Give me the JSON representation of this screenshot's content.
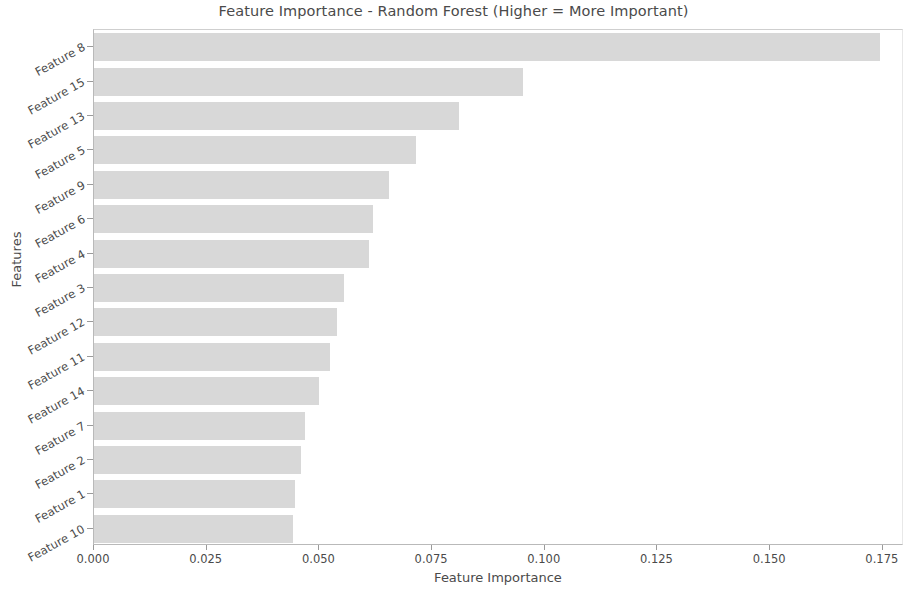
{
  "chart_data": {
    "type": "bar",
    "orientation": "horizontal",
    "title": "Feature Importance - Random Forest (Higher = More Important)",
    "xlabel": "Feature Importance",
    "ylabel": "Features",
    "categories": [
      "Feature 8",
      "Feature 15",
      "Feature 13",
      "Feature 5",
      "Feature 9",
      "Feature 6",
      "Feature 4",
      "Feature 3",
      "Feature 12",
      "Feature 11",
      "Feature 14",
      "Feature 7",
      "Feature 2",
      "Feature 1",
      "Feature 10"
    ],
    "values": [
      0.1743,
      0.0951,
      0.0809,
      0.0714,
      0.0654,
      0.0619,
      0.061,
      0.0554,
      0.0539,
      0.0523,
      0.0499,
      0.0468,
      0.0459,
      0.0446,
      0.0441
    ],
    "xlim": [
      0.0,
      0.1797
    ],
    "xticks": [
      0.0,
      0.025,
      0.05,
      0.075,
      0.1,
      0.125,
      0.15,
      0.175
    ],
    "xtick_labels": [
      "0.000",
      "0.025",
      "0.050",
      "0.075",
      "0.100",
      "0.125",
      "0.150",
      "0.175"
    ],
    "grid": false,
    "legend": null,
    "bar_color": "#d8d8d8",
    "bar_edge_color": "#d8d8d8",
    "axis_color": "#b9b9b9",
    "text_color": "#4a4a4a"
  }
}
